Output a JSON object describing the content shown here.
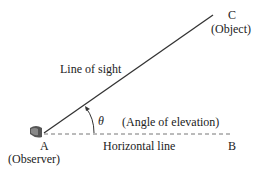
{
  "diagram": {
    "points": {
      "A": {
        "label": "A",
        "caption": "(Observer)"
      },
      "B": {
        "label": "B"
      },
      "C": {
        "label": "C",
        "caption": "(Object)"
      }
    },
    "line_of_sight_label": "Line of sight",
    "horizontal_line_label": "Horizontal line",
    "angle_symbol": "θ",
    "angle_caption": "(Angle of elevation)",
    "icons": [
      "eye-icon"
    ],
    "colors": {
      "line": "#333333",
      "dashed": "#777777",
      "text": "#222222"
    }
  }
}
